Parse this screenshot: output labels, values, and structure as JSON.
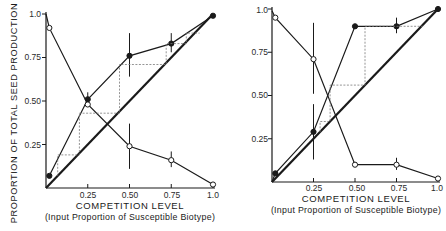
{
  "chart_data": [
    {
      "type": "line",
      "panel": "left",
      "title": "",
      "xlabel": "COMPETITION LEVEL",
      "xlabel_sub": "(Input Proportion of Susceptible Biotype)",
      "ylabel": "PROPORTION OF TOTAL SEED PRODUCTION",
      "xlim": [
        0,
        1.0
      ],
      "ylim": [
        0,
        1.0
      ],
      "x_ticks": [
        "0.25",
        "0.50",
        "0.75",
        "1.0"
      ],
      "y_ticks": [
        "0.25",
        "0.50",
        "0.75",
        "1.0"
      ],
      "grid": false,
      "series": [
        {
          "name": "susceptible (filled circles)",
          "marker": "filled",
          "x": [
            0.02,
            0.25,
            0.5,
            0.75,
            1.0
          ],
          "values": [
            0.07,
            0.51,
            0.76,
            0.83,
            0.99
          ],
          "error_bars": [
            null,
            [
              0.47,
              0.55
            ],
            [
              0.64,
              0.89
            ],
            [
              0.78,
              0.89
            ],
            null
          ]
        },
        {
          "name": "resistant (open circles)",
          "marker": "open",
          "x": [
            0.0,
            0.02,
            0.25,
            0.5,
            0.75,
            1.0
          ],
          "values": [
            1.0,
            0.92,
            0.48,
            0.24,
            0.16,
            0.02
          ],
          "error_bars": [
            null,
            null,
            null,
            [
              0.11,
              0.37
            ],
            [
              0.12,
              0.21
            ],
            null
          ]
        },
        {
          "name": "1:1 line",
          "marker": "none",
          "x": [
            0,
            1.0
          ],
          "values": [
            0,
            1.0
          ]
        },
        {
          "name": "iteration staircase (dashed)",
          "marker": "none",
          "style": "dashed",
          "x": [
            0.07,
            0.07,
            0.2,
            0.2,
            0.44,
            0.44,
            0.72,
            0.72,
            0.84,
            0.84,
            0.92
          ],
          "values": [
            0.07,
            0.19,
            0.19,
            0.43,
            0.43,
            0.71,
            0.71,
            0.83,
            0.83,
            0.89,
            0.89
          ]
        }
      ]
    },
    {
      "type": "line",
      "panel": "right",
      "title": "",
      "xlabel": "COMPETITION LEVEL",
      "xlabel_sub": "(Input Proportion of Susceptible Biotype)",
      "ylabel": "",
      "xlim": [
        0,
        1.0
      ],
      "ylim": [
        0,
        1.0
      ],
      "x_ticks": [
        "0.25",
        "0.50",
        "0.75",
        "1.0"
      ],
      "y_ticks": [
        "0.25",
        "0.50",
        "0.75",
        "1.0"
      ],
      "grid": false,
      "series": [
        {
          "name": "susceptible (filled circles)",
          "marker": "filled",
          "x": [
            0.0,
            0.02,
            0.25,
            0.5,
            0.75,
            1.0
          ],
          "values": [
            0.0,
            0.05,
            0.29,
            0.9,
            0.9,
            1.0
          ],
          "error_bars": [
            null,
            null,
            [
              0.13,
              0.45
            ],
            null,
            [
              0.86,
              0.95
            ],
            null
          ]
        },
        {
          "name": "resistant (open circles)",
          "marker": "open",
          "x": [
            0.0,
            0.02,
            0.25,
            0.5,
            0.75,
            1.0
          ],
          "values": [
            0.99,
            0.95,
            0.71,
            0.1,
            0.1,
            0.02
          ],
          "error_bars": [
            null,
            null,
            [
              0.51,
              0.92
            ],
            null,
            [
              0.07,
              0.14
            ],
            null
          ]
        },
        {
          "name": "1:1 line",
          "marker": "none",
          "x": [
            0,
            1.0
          ],
          "values": [
            0,
            1.0
          ]
        },
        {
          "name": "iteration staircase (dashed)",
          "marker": "none",
          "style": "dashed",
          "x": [
            0.29,
            0.29,
            0.35,
            0.35,
            0.56,
            0.56,
            0.92
          ],
          "values": [
            0.29,
            0.35,
            0.35,
            0.56,
            0.56,
            0.9,
            0.9
          ]
        }
      ]
    }
  ],
  "labels": {
    "left": {
      "ylabel": "PROPORTION OF TOTAL SEED PRODUCTION",
      "y_ticks": [
        "1.0",
        "0.75",
        "0.50",
        "0.25"
      ],
      "x_ticks": [
        "0.25",
        "0.50",
        "0.75",
        "1.0"
      ],
      "xlabel": "COMPETITION LEVEL",
      "xlabel_sub": "(Input Proportion of Susceptible Biotype)"
    },
    "right": {
      "y_ticks": [
        "1.0",
        "0.75",
        "0.50",
        "0.25"
      ],
      "x_ticks": [
        "0.25",
        "0.50",
        "0.75",
        "1.0"
      ],
      "xlabel": "COMPETITION LEVEL",
      "xlabel_sub": "(Input Proportion of Susceptible Biotype)"
    }
  },
  "colors": {
    "ink": "#1a1a1a",
    "dashed": "#7a7a7a",
    "background": "#ffffff"
  }
}
